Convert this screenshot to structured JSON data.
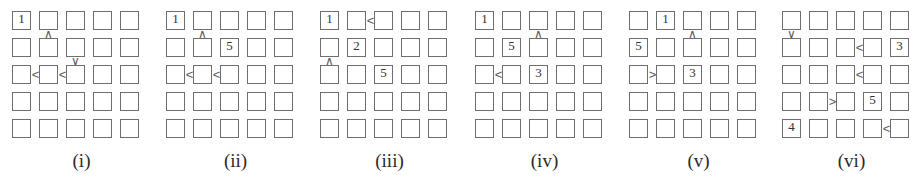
{
  "figure": {
    "kind": "futoshiki-puzzle-row",
    "grid_size": 5,
    "cell_pitch_px": 27,
    "puzzle_left_offsets_px": [
      12,
      166,
      320,
      475,
      629,
      782
    ],
    "colors": {
      "cell_border": "#6e6e6e",
      "digit": "#333333",
      "constraint": "#5a5a5a",
      "caption": "#2b2b2b",
      "background": "#ffffff"
    },
    "puzzles": [
      {
        "caption": "(i)",
        "givens": [
          {
            "row": 0,
            "col": 0,
            "value": "1"
          }
        ],
        "constraints": [
          {
            "orient": "v",
            "row": 0,
            "col": 1,
            "glyph": "∧",
            "label": "up-caret"
          },
          {
            "orient": "v",
            "row": 1,
            "col": 2,
            "glyph": "∨",
            "label": "down-caret"
          },
          {
            "orient": "h",
            "row": 2,
            "col": 0,
            "glyph": "<",
            "label": "less-than"
          },
          {
            "orient": "h",
            "row": 2,
            "col": 1,
            "glyph": "<",
            "label": "less-than"
          }
        ]
      },
      {
        "caption": "(ii)",
        "givens": [
          {
            "row": 0,
            "col": 0,
            "value": "1"
          },
          {
            "row": 1,
            "col": 2,
            "value": "5"
          }
        ],
        "constraints": [
          {
            "orient": "v",
            "row": 0,
            "col": 1,
            "glyph": "∧",
            "label": "up-caret"
          },
          {
            "orient": "h",
            "row": 2,
            "col": 0,
            "glyph": "<",
            "label": "less-than"
          },
          {
            "orient": "h",
            "row": 2,
            "col": 1,
            "glyph": "<",
            "label": "less-than"
          }
        ]
      },
      {
        "caption": "(iii)",
        "givens": [
          {
            "row": 0,
            "col": 0,
            "value": "1"
          },
          {
            "row": 1,
            "col": 1,
            "value": "2"
          },
          {
            "row": 2,
            "col": 2,
            "value": "5"
          }
        ],
        "constraints": [
          {
            "orient": "h",
            "row": 0,
            "col": 1,
            "glyph": "<",
            "label": "less-than"
          },
          {
            "orient": "v",
            "row": 1,
            "col": 0,
            "glyph": "∧",
            "label": "up-caret"
          }
        ]
      },
      {
        "caption": "(iv)",
        "givens": [
          {
            "row": 0,
            "col": 0,
            "value": "1"
          },
          {
            "row": 1,
            "col": 1,
            "value": "5"
          },
          {
            "row": 2,
            "col": 2,
            "value": "3"
          }
        ],
        "constraints": [
          {
            "orient": "v",
            "row": 0,
            "col": 2,
            "glyph": "∧",
            "label": "up-caret"
          },
          {
            "orient": "h",
            "row": 2,
            "col": 0,
            "glyph": "<",
            "label": "less-than"
          }
        ]
      },
      {
        "caption": "(v)",
        "givens": [
          {
            "row": 0,
            "col": 1,
            "value": "1"
          },
          {
            "row": 1,
            "col": 0,
            "value": "5"
          },
          {
            "row": 2,
            "col": 2,
            "value": "3"
          }
        ],
        "constraints": [
          {
            "orient": "v",
            "row": 0,
            "col": 2,
            "glyph": "∧",
            "label": "up-caret"
          },
          {
            "orient": "h",
            "row": 2,
            "col": 0,
            "glyph": ">",
            "label": "greater-than"
          }
        ]
      },
      {
        "caption": "(vi)",
        "givens": [
          {
            "row": 1,
            "col": 4,
            "value": "3"
          },
          {
            "row": 3,
            "col": 3,
            "value": "5"
          },
          {
            "row": 4,
            "col": 0,
            "value": "4"
          }
        ],
        "constraints": [
          {
            "orient": "v",
            "row": 0,
            "col": 0,
            "glyph": "∨",
            "label": "down-caret"
          },
          {
            "orient": "h",
            "row": 1,
            "col": 2,
            "glyph": "<",
            "label": "less-than"
          },
          {
            "orient": "h",
            "row": 2,
            "col": 2,
            "glyph": "<",
            "label": "less-than"
          },
          {
            "orient": "h",
            "row": 3,
            "col": 1,
            "glyph": ">",
            "label": "greater-than"
          },
          {
            "orient": "h",
            "row": 4,
            "col": 3,
            "glyph": "<",
            "label": "less-than"
          }
        ]
      }
    ]
  }
}
